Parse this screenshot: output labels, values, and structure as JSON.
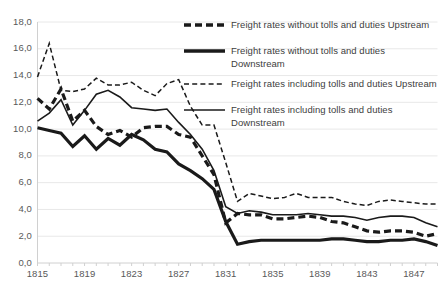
{
  "chart_data": {
    "type": "line",
    "title": "",
    "xlabel": "",
    "ylabel": "",
    "xlim": [
      1815,
      1849
    ],
    "ylim": [
      0.0,
      18.0
    ],
    "y_tick_step": 2.0,
    "grid": "horizontal",
    "decimal_separator": ",",
    "legend_position": "top-right-inside",
    "x_tick_labels": [
      "1815",
      "1819",
      "1823",
      "1827",
      "1831",
      "1835",
      "1839",
      "1843",
      "1847"
    ],
    "x_tick_values": [
      1815,
      1819,
      1823,
      1827,
      1831,
      1835,
      1839,
      1843,
      1847
    ],
    "y_tick_labels": [
      "0,0",
      "2,0",
      "4,0",
      "6,0",
      "8,0",
      "10,0",
      "12,0",
      "14,0",
      "16,0",
      "18,0"
    ],
    "y_tick_values": [
      0.0,
      2.0,
      4.0,
      6.0,
      8.0,
      10.0,
      12.0,
      14.0,
      16.0,
      18.0
    ],
    "x": [
      1815,
      1816,
      1817,
      1818,
      1819,
      1820,
      1821,
      1822,
      1823,
      1824,
      1825,
      1826,
      1827,
      1828,
      1829,
      1830,
      1831,
      1832,
      1833,
      1834,
      1835,
      1836,
      1837,
      1838,
      1839,
      1840,
      1841,
      1842,
      1843,
      1844,
      1845,
      1846,
      1847,
      1848,
      1849
    ],
    "series": [
      {
        "name": "Freight rates without tolls and duties Upstream",
        "style": "thick-dashed",
        "color": "#1a1a1a",
        "width": 3.2,
        "dash": "7,4",
        "values": [
          12.3,
          11.5,
          13.0,
          10.6,
          11.4,
          10.2,
          9.6,
          9.9,
          9.4,
          10.1,
          10.2,
          10.2,
          9.6,
          9.4,
          8.0,
          6.6,
          3.0,
          3.7,
          3.6,
          3.6,
          3.3,
          3.3,
          3.4,
          3.5,
          3.4,
          3.1,
          3.0,
          2.7,
          2.4,
          2.3,
          2.4,
          2.4,
          2.3,
          2.0,
          2.2
        ]
      },
      {
        "name": "Freight rates without tolls and duties Downstream",
        "style": "thick-solid",
        "color": "#1a1a1a",
        "width": 3.2,
        "dash": "none",
        "values": [
          10.1,
          9.9,
          9.7,
          8.7,
          9.5,
          8.5,
          9.3,
          8.8,
          9.6,
          9.2,
          8.5,
          8.3,
          7.4,
          6.9,
          6.3,
          5.5,
          3.1,
          1.4,
          1.6,
          1.7,
          1.7,
          1.7,
          1.7,
          1.7,
          1.7,
          1.8,
          1.8,
          1.7,
          1.6,
          1.6,
          1.7,
          1.7,
          1.8,
          1.6,
          1.3
        ]
      },
      {
        "name": "Freight rates including tolls and duties Upstream",
        "style": "thin-dashed",
        "color": "#1a1a1a",
        "width": 1.5,
        "dash": "5,3",
        "values": [
          13.9,
          16.4,
          12.9,
          12.8,
          13.0,
          13.8,
          13.3,
          13.3,
          13.5,
          12.9,
          12.5,
          13.4,
          13.7,
          11.7,
          10.3,
          10.3,
          7.5,
          4.6,
          5.2,
          5.0,
          4.8,
          4.9,
          5.2,
          4.9,
          4.9,
          4.9,
          4.6,
          4.4,
          4.3,
          4.6,
          4.7,
          4.6,
          4.5,
          4.4,
          4.4
        ]
      },
      {
        "name": "Freight rates including tolls and duties Downstream",
        "style": "thin-solid",
        "color": "#1a1a1a",
        "width": 1.6,
        "dash": "none",
        "values": [
          10.6,
          11.2,
          12.2,
          10.3,
          11.4,
          12.6,
          12.9,
          12.4,
          11.6,
          11.5,
          11.4,
          11.5,
          10.5,
          9.6,
          8.5,
          6.9,
          4.2,
          3.7,
          3.9,
          3.8,
          3.6,
          3.6,
          3.6,
          3.7,
          3.6,
          3.5,
          3.5,
          3.4,
          3.2,
          3.4,
          3.5,
          3.5,
          3.4,
          3.0,
          2.7
        ]
      }
    ],
    "legend": [
      {
        "label": "Freight rates without tolls and duties Upstream",
        "key_style": "thick-dashed"
      },
      {
        "label": "Freight rates without tolls and duties Downstream",
        "key_style": "thick-solid"
      },
      {
        "label": "Freight rates including tolls and duties Upstream",
        "key_style": "thin-dashed"
      },
      {
        "label": "Freight rates including tolls and duties Downstream",
        "key_style": "thin-solid"
      }
    ]
  },
  "colors": {
    "line": "#1a1a1a",
    "grid": "#e8e8e8",
    "axis": "#d0d0d0",
    "tick_text": "#595959",
    "legend_text": "#404040",
    "background": "#ffffff"
  }
}
